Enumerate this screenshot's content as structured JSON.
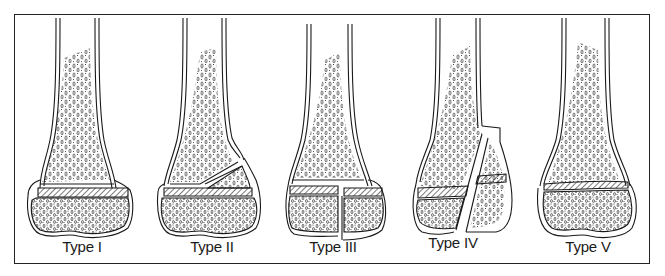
{
  "figure": {
    "panels": [
      {
        "id": "type-1",
        "label": "Type I",
        "center_x": 72
      },
      {
        "id": "type-2",
        "label": "Type II",
        "center_x": 205
      },
      {
        "id": "type-3",
        "label": "Type III",
        "center_x": 331
      },
      {
        "id": "type-4",
        "label": "Type IV",
        "center_x": 455
      },
      {
        "id": "type-5",
        "label": "Type V",
        "center_x": 585
      }
    ]
  },
  "colors": {
    "line": "#1a1a1a",
    "background": "#ffffff",
    "stipple": "#333333"
  }
}
